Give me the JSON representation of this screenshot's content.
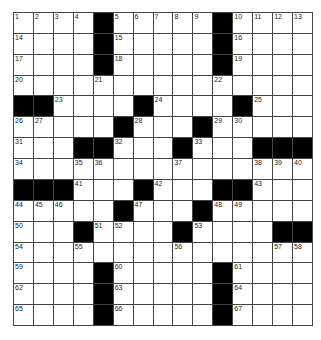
{
  "puzzle": {
    "size": {
      "rows": 15,
      "cols": 15
    },
    "layout": [
      "....#.....#....",
      "....#.....#....",
      "....#.....#....",
      "...............",
      "##....#....#...",
      ".....#...#.....",
      "...##...#...###",
      "...............",
      "###...#...##...",
      ".....#...#.....",
      "...#....#....##",
      "...............",
      "....#.....#....",
      "....#.....#....",
      "....#.....#...."
    ],
    "numbers": [
      {
        "r": 0,
        "c": 0,
        "n": "1"
      },
      {
        "r": 0,
        "c": 1,
        "n": "2"
      },
      {
        "r": 0,
        "c": 2,
        "n": "3"
      },
      {
        "r": 0,
        "c": 3,
        "n": "4"
      },
      {
        "r": 0,
        "c": 5,
        "n": "5"
      },
      {
        "r": 0,
        "c": 6,
        "n": "6"
      },
      {
        "r": 0,
        "c": 7,
        "n": "7"
      },
      {
        "r": 0,
        "c": 8,
        "n": "8"
      },
      {
        "r": 0,
        "c": 9,
        "n": "9"
      },
      {
        "r": 0,
        "c": 11,
        "n": "10"
      },
      {
        "r": 0,
        "c": 12,
        "n": "11"
      },
      {
        "r": 0,
        "c": 13,
        "n": "12"
      },
      {
        "r": 0,
        "c": 14,
        "n": "13"
      },
      {
        "r": 1,
        "c": 0,
        "n": "14"
      },
      {
        "r": 1,
        "c": 5,
        "n": "15"
      },
      {
        "r": 1,
        "c": 11,
        "n": "16"
      },
      {
        "r": 2,
        "c": 0,
        "n": "17"
      },
      {
        "r": 2,
        "c": 5,
        "n": "18"
      },
      {
        "r": 2,
        "c": 11,
        "n": "19"
      },
      {
        "r": 3,
        "c": 0,
        "n": "20"
      },
      {
        "r": 3,
        "c": 4,
        "n": "21"
      },
      {
        "r": 3,
        "c": 10,
        "n": "22"
      },
      {
        "r": 4,
        "c": 2,
        "n": "23"
      },
      {
        "r": 4,
        "c": 7,
        "n": "24"
      },
      {
        "r": 4,
        "c": 12,
        "n": "25"
      },
      {
        "r": 5,
        "c": 0,
        "n": "26"
      },
      {
        "r": 5,
        "c": 1,
        "n": "27"
      },
      {
        "r": 5,
        "c": 6,
        "n": "28"
      },
      {
        "r": 5,
        "c": 10,
        "n": "29"
      },
      {
        "r": 5,
        "c": 11,
        "n": "30"
      },
      {
        "r": 6,
        "c": 0,
        "n": "31"
      },
      {
        "r": 6,
        "c": 5,
        "n": "32"
      },
      {
        "r": 6,
        "c": 9,
        "n": "33"
      },
      {
        "r": 7,
        "c": 0,
        "n": "34"
      },
      {
        "r": 7,
        "c": 3,
        "n": "35"
      },
      {
        "r": 7,
        "c": 4,
        "n": "36"
      },
      {
        "r": 7,
        "c": 8,
        "n": "37"
      },
      {
        "r": 7,
        "c": 12,
        "n": "38"
      },
      {
        "r": 7,
        "c": 13,
        "n": "39"
      },
      {
        "r": 7,
        "c": 14,
        "n": "40"
      },
      {
        "r": 8,
        "c": 3,
        "n": "41"
      },
      {
        "r": 8,
        "c": 7,
        "n": "42"
      },
      {
        "r": 8,
        "c": 12,
        "n": "43"
      },
      {
        "r": 9,
        "c": 0,
        "n": "44"
      },
      {
        "r": 9,
        "c": 1,
        "n": "45"
      },
      {
        "r": 9,
        "c": 2,
        "n": "46"
      },
      {
        "r": 9,
        "c": 6,
        "n": "47"
      },
      {
        "r": 9,
        "c": 10,
        "n": "48"
      },
      {
        "r": 9,
        "c": 11,
        "n": "49"
      },
      {
        "r": 10,
        "c": 0,
        "n": "50"
      },
      {
        "r": 10,
        "c": 4,
        "n": "51"
      },
      {
        "r": 10,
        "c": 5,
        "n": "52"
      },
      {
        "r": 10,
        "c": 9,
        "n": "53"
      },
      {
        "r": 11,
        "c": 0,
        "n": "54"
      },
      {
        "r": 11,
        "c": 3,
        "n": "55"
      },
      {
        "r": 11,
        "c": 8,
        "n": "56"
      },
      {
        "r": 11,
        "c": 13,
        "n": "57"
      },
      {
        "r": 11,
        "c": 14,
        "n": "58"
      },
      {
        "r": 12,
        "c": 0,
        "n": "59"
      },
      {
        "r": 12,
        "c": 5,
        "n": "60"
      },
      {
        "r": 12,
        "c": 11,
        "n": "61"
      },
      {
        "r": 13,
        "c": 0,
        "n": "62"
      },
      {
        "r": 13,
        "c": 5,
        "n": "63"
      },
      {
        "r": 13,
        "c": 11,
        "n": "64"
      },
      {
        "r": 14,
        "c": 0,
        "n": "65"
      },
      {
        "r": 14,
        "c": 5,
        "n": "66"
      },
      {
        "r": 14,
        "c": 11,
        "n": "67"
      }
    ]
  }
}
